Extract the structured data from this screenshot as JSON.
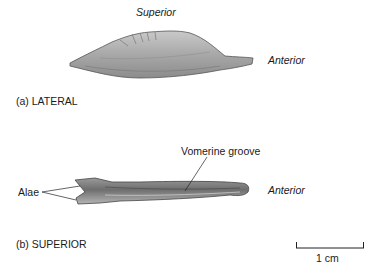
{
  "panel_a": {
    "caption": "(a) LATERAL",
    "labels": {
      "superior": "Superior",
      "anterior": "Anterior"
    }
  },
  "panel_b": {
    "caption": "(b) SUPERIOR",
    "labels": {
      "vomerine_groove": "Vomerine groove",
      "alae": "Alae",
      "anterior": "Anterior"
    }
  },
  "scale_bar": {
    "label": "1 cm"
  },
  "colors": {
    "bone_light": "#d8d8d8",
    "bone_mid": "#a9a9a9",
    "bone_dark": "#6e6e6e",
    "line": "#222222"
  }
}
